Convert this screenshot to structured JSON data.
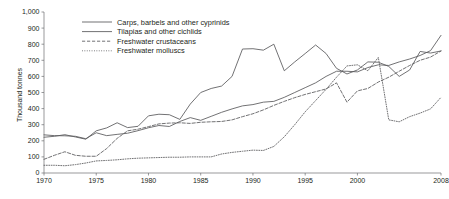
{
  "chart_data": {
    "type": "line",
    "title": "",
    "xlabel": "",
    "ylabel": "Thousand tonnes",
    "xlim": [
      1970,
      2008
    ],
    "ylim": [
      0,
      1000
    ],
    "grid": false,
    "legend_position": "top-left",
    "x": [
      1970,
      1971,
      1972,
      1973,
      1974,
      1975,
      1976,
      1977,
      1978,
      1979,
      1980,
      1981,
      1982,
      1983,
      1984,
      1985,
      1986,
      1987,
      1988,
      1989,
      1990,
      1991,
      1992,
      1993,
      1994,
      1995,
      1996,
      1997,
      1998,
      1999,
      2000,
      2001,
      2002,
      2003,
      2004,
      2005,
      2006,
      2007,
      2008
    ],
    "xticks": [
      1970,
      1975,
      1980,
      1985,
      1990,
      1995,
      2000,
      2008
    ],
    "xtick_labels": [
      "1970",
      "1975",
      "1980",
      "1985",
      "1990",
      "1995",
      "2000",
      "2008"
    ],
    "yticks": [
      0,
      100,
      200,
      300,
      400,
      500,
      600,
      700,
      800,
      900,
      1000
    ],
    "ytick_labels": [
      "0",
      "100",
      "200",
      "300",
      "400",
      "500",
      "600",
      "700",
      "800",
      "900",
      "1,000"
    ],
    "series": [
      {
        "name": "Carps, barbels and other cyprinids",
        "style": "solid",
        "values": [
          237,
          232,
          231,
          228,
          213,
          250,
          232,
          240,
          247,
          263,
          281,
          295,
          289,
          320,
          344,
          327,
          352,
          377,
          398,
          417,
          425,
          440,
          445,
          470,
          500,
          530,
          560,
          600,
          632,
          632,
          628,
          655,
          672,
          668,
          690,
          708,
          730,
          760,
          855
        ]
      },
      {
        "name": "Tilapias and other cichlids",
        "style": "solid",
        "values": [
          222,
          228,
          238,
          224,
          210,
          262,
          280,
          312,
          282,
          290,
          355,
          365,
          362,
          333,
          428,
          500,
          525,
          540,
          600,
          770,
          772,
          763,
          800,
          635,
          690,
          742,
          795,
          742,
          650,
          615,
          640,
          690,
          688,
          662,
          600,
          640,
          755,
          745,
          758
        ]
      },
      {
        "name": "Freshwater crustaceans",
        "style": "dashed",
        "values": [
          85,
          110,
          132,
          110,
          104,
          104,
          152,
          215,
          262,
          272,
          288,
          305,
          310,
          312,
          308,
          315,
          318,
          320,
          330,
          350,
          368,
          392,
          420,
          445,
          468,
          488,
          505,
          522,
          560,
          440,
          510,
          525,
          565,
          595,
          632,
          668,
          700,
          720,
          758
        ]
      },
      {
        "name": "Freshwater molluscs",
        "style": "dotted",
        "values": [
          48,
          48,
          45,
          52,
          62,
          75,
          78,
          82,
          88,
          92,
          94,
          96,
          98,
          98,
          100,
          100,
          100,
          118,
          128,
          135,
          142,
          140,
          165,
          225,
          300,
          380,
          450,
          520,
          595,
          665,
          672,
          635,
          718,
          330,
          318,
          350,
          372,
          398,
          470
        ]
      }
    ]
  },
  "axis": {
    "y_title": "Thousand tonnes"
  }
}
